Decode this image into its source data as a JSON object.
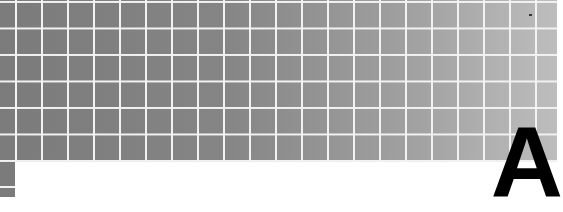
{
  "banner": {
    "letter": "A",
    "colors": {
      "tile_dark": "#7b7b7b",
      "tile_light": "#bdbdbd",
      "grid_line": "#f2f2f2",
      "letter": "#000000",
      "background": "#ffffff"
    },
    "grid": {
      "cell_size_px": 26,
      "line_width_px": 2
    }
  }
}
